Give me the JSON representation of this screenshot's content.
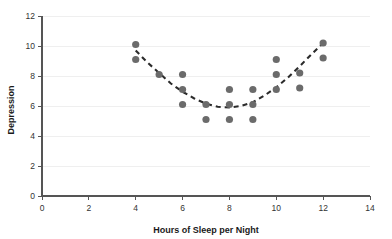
{
  "chart_data": {
    "type": "scatter",
    "title": "",
    "xlabel": "Hours of Sleep per Night",
    "ylabel": "Depression",
    "xlim": [
      0,
      14
    ],
    "ylim": [
      0,
      12
    ],
    "xticks": [
      0,
      2,
      4,
      6,
      8,
      10,
      12,
      14
    ],
    "yticks": [
      0,
      2,
      4,
      6,
      8,
      10,
      12
    ],
    "grid": "horizontal",
    "legend": "none",
    "marker_color": "#6b6b6b",
    "trendline": {
      "style": "dashed",
      "color": "#2b2b2b",
      "shape": "quadratic",
      "description": "U-shaped quadratic fit with minimum near 8 hours",
      "points": [
        {
          "x": 4.0,
          "y": 9.7
        },
        {
          "x": 4.5,
          "y": 8.9
        },
        {
          "x": 5.0,
          "y": 8.2
        },
        {
          "x": 5.5,
          "y": 7.5
        },
        {
          "x": 6.0,
          "y": 6.95
        },
        {
          "x": 6.5,
          "y": 6.5
        },
        {
          "x": 7.0,
          "y": 6.15
        },
        {
          "x": 7.5,
          "y": 5.95
        },
        {
          "x": 8.0,
          "y": 5.9
        },
        {
          "x": 8.5,
          "y": 6.0
        },
        {
          "x": 9.0,
          "y": 6.25
        },
        {
          "x": 9.5,
          "y": 6.7
        },
        {
          "x": 10.0,
          "y": 7.25
        },
        {
          "x": 10.5,
          "y": 7.9
        },
        {
          "x": 11.0,
          "y": 8.65
        },
        {
          "x": 11.5,
          "y": 9.45
        },
        {
          "x": 12.0,
          "y": 10.2
        }
      ]
    },
    "points": [
      {
        "x": 4,
        "y": 10.1
      },
      {
        "x": 4,
        "y": 9.1
      },
      {
        "x": 5,
        "y": 8.1
      },
      {
        "x": 6,
        "y": 8.1
      },
      {
        "x": 6,
        "y": 7.1
      },
      {
        "x": 6,
        "y": 6.1
      },
      {
        "x": 7,
        "y": 6.1
      },
      {
        "x": 7,
        "y": 5.1
      },
      {
        "x": 8,
        "y": 7.1
      },
      {
        "x": 8,
        "y": 6.1
      },
      {
        "x": 8,
        "y": 5.1
      },
      {
        "x": 9,
        "y": 7.1
      },
      {
        "x": 9,
        "y": 6.1
      },
      {
        "x": 9,
        "y": 5.1
      },
      {
        "x": 10,
        "y": 9.1
      },
      {
        "x": 10,
        "y": 8.1
      },
      {
        "x": 10,
        "y": 7.1
      },
      {
        "x": 11,
        "y": 8.2
      },
      {
        "x": 11,
        "y": 7.2
      },
      {
        "x": 12,
        "y": 10.2
      },
      {
        "x": 12,
        "y": 9.2
      }
    ]
  }
}
